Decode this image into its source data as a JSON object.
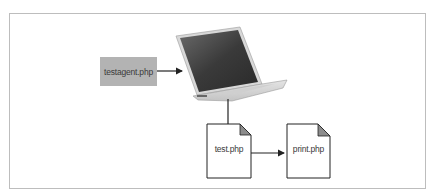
{
  "diagram": {
    "nodes": [
      {
        "id": "testagent",
        "label": "testagent.php",
        "shape": "shaded-rectangle",
        "fill": "#b3b3b3"
      },
      {
        "id": "laptop",
        "label": "",
        "shape": "laptop-image"
      },
      {
        "id": "test",
        "label": "test.php",
        "shape": "document"
      },
      {
        "id": "print",
        "label": "print.php",
        "shape": "document"
      }
    ],
    "edges": [
      {
        "from": "testagent",
        "to": "laptop",
        "style": "arrow"
      },
      {
        "from": "laptop",
        "to": "test",
        "style": "line"
      },
      {
        "from": "test",
        "to": "print",
        "style": "arrow"
      }
    ]
  },
  "labels": {
    "testagent": "testagent.php",
    "test": "test.php",
    "print": "print.php"
  }
}
